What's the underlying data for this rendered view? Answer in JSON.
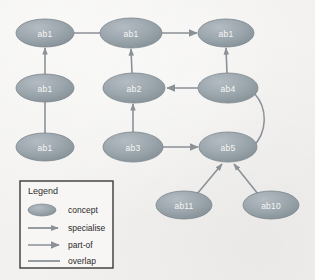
{
  "diagram": {
    "background_color": "#f2f1ef",
    "node_fill": "#9aa4ac",
    "node_stroke": "#7b858d",
    "node_text_color": "#f7f7f6",
    "edge_color": "#8b9197",
    "nodes": [
      {
        "id": "n1",
        "label": "ab1",
        "cx": 45,
        "cy": 33,
        "rx": 29,
        "ry": 14
      },
      {
        "id": "n2",
        "label": "ab1",
        "cx": 45,
        "cy": 88,
        "rx": 29,
        "ry": 14
      },
      {
        "id": "n3",
        "label": "ab1",
        "cx": 45,
        "cy": 147,
        "rx": 29,
        "ry": 14
      },
      {
        "id": "n4",
        "label": "ab1",
        "cx": 131,
        "cy": 33,
        "rx": 31,
        "ry": 15
      },
      {
        "id": "n5",
        "label": "ab2",
        "cx": 134,
        "cy": 88,
        "rx": 31,
        "ry": 15
      },
      {
        "id": "n6",
        "label": "ab3",
        "cx": 133,
        "cy": 147,
        "rx": 30,
        "ry": 15
      },
      {
        "id": "n7",
        "label": "ab1",
        "cx": 226,
        "cy": 33,
        "rx": 28,
        "ry": 14
      },
      {
        "id": "n8",
        "label": "ab4",
        "cx": 228,
        "cy": 88,
        "rx": 30,
        "ry": 15
      },
      {
        "id": "n9",
        "label": "ab5",
        "cx": 228,
        "cy": 147,
        "rx": 29,
        "ry": 15
      },
      {
        "id": "n10",
        "label": "ab11",
        "cx": 184,
        "cy": 205,
        "rx": 28,
        "ry": 14
      },
      {
        "id": "n11",
        "label": "ab10",
        "cx": 271,
        "cy": 205,
        "rx": 28,
        "ry": 14
      }
    ],
    "edges": [
      {
        "id": "e1",
        "from": "n1",
        "to": "n4",
        "type": "overlap",
        "arrow": "none"
      },
      {
        "id": "e2",
        "from": "n4",
        "to": "n7",
        "type": "part-of",
        "arrow": "to"
      },
      {
        "id": "e3",
        "from": "n2",
        "to": "n1",
        "type": "specialise",
        "arrow": "to"
      },
      {
        "id": "e4",
        "from": "n3",
        "to": "n2",
        "type": "overlap",
        "arrow": "none"
      },
      {
        "id": "e5",
        "from": "n5",
        "to": "n4",
        "type": "specialise",
        "arrow": "to"
      },
      {
        "id": "e6",
        "from": "n6",
        "to": "n5",
        "type": "specialise",
        "arrow": "to"
      },
      {
        "id": "e7",
        "from": "n8",
        "to": "n5",
        "type": "part-of",
        "arrow": "to"
      },
      {
        "id": "e8",
        "from": "n8",
        "to": "n7",
        "type": "specialise",
        "arrow": "to"
      },
      {
        "id": "e9",
        "from": "n6",
        "to": "n9",
        "type": "part-of",
        "arrow": "to"
      },
      {
        "id": "e10",
        "from": "n8",
        "to": "n9",
        "type": "overlap",
        "arrow": "none",
        "curved": true
      },
      {
        "id": "e11",
        "from": "n10",
        "to": "n9",
        "type": "specialise",
        "arrow": "to"
      },
      {
        "id": "e12",
        "from": "n11",
        "to": "n9",
        "type": "specialise",
        "arrow": "to"
      }
    ]
  },
  "legend": {
    "title": "Legend",
    "box": {
      "x": 20,
      "y": 181,
      "width": 93,
      "height": 87
    },
    "items": [
      {
        "symbol": "ellipse",
        "label": "concept"
      },
      {
        "symbol": "line-arrow-sm",
        "label": "specialise"
      },
      {
        "symbol": "line-arrow",
        "label": "part-of"
      },
      {
        "symbol": "line-plain",
        "label": "overlap"
      }
    ]
  }
}
